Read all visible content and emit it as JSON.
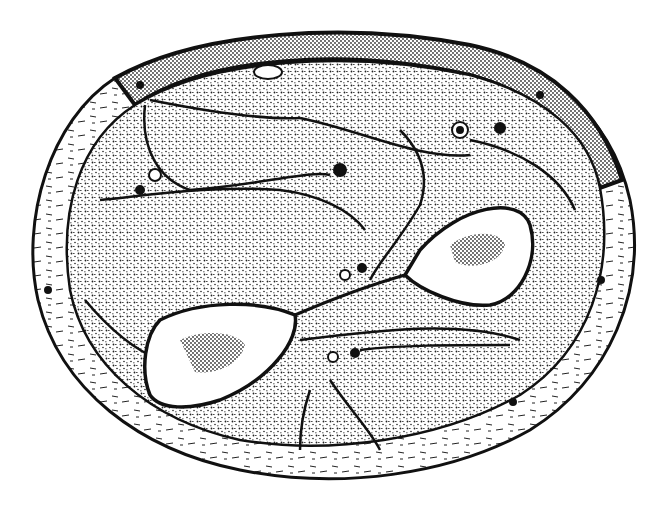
{
  "figure": {
    "labels": [],
    "colors": {
      "ink": "#111111",
      "paper": "#ffffff",
      "stipple": "#222222"
    }
  }
}
